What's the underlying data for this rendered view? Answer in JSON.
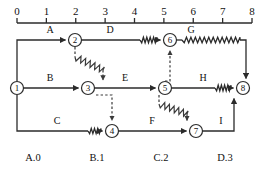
{
  "diagram": {
    "colors": {
      "line": "#2b2b2b",
      "dashed": "#3a3a3a",
      "text": "#111111",
      "background": "#ffffff"
    },
    "axis": {
      "name": "time-scale",
      "ticks": [
        "0",
        "1",
        "2",
        "3",
        "4",
        "5",
        "6",
        "7",
        "8"
      ],
      "min": 0,
      "max": 8
    },
    "nodes": [
      {
        "id": "1",
        "label": "1",
        "x": 17,
        "y": 88
      },
      {
        "id": "2",
        "label": "2",
        "x": 75,
        "y": 40
      },
      {
        "id": "3",
        "label": "3",
        "x": 88,
        "y": 88
      },
      {
        "id": "4",
        "label": "4",
        "x": 112,
        "y": 131
      },
      {
        "id": "5",
        "label": "5",
        "x": 165,
        "y": 88
      },
      {
        "id": "6",
        "label": "6",
        "x": 170,
        "y": 40
      },
      {
        "id": "7",
        "label": "7",
        "x": 196,
        "y": 131
      },
      {
        "id": "8",
        "label": "8",
        "x": 243,
        "y": 88
      }
    ],
    "edges": [
      {
        "id": "A",
        "label": "A",
        "from": "1",
        "to": "2",
        "style": "solid",
        "label_x": 50,
        "label_y": 33
      },
      {
        "id": "B",
        "label": "B",
        "from": "1",
        "to": "3",
        "style": "solid",
        "label_x": 50,
        "label_y": 81
      },
      {
        "id": "C",
        "label": "C",
        "from": "1",
        "to": "4",
        "style": "spring",
        "label_x": 57,
        "label_y": 124
      },
      {
        "id": "D",
        "label": "D",
        "from": "2",
        "to": "6",
        "style": "spring",
        "label_x": 110,
        "label_y": 33
      },
      {
        "id": "E",
        "label": "E",
        "from": "3",
        "to": "5",
        "style": "solid",
        "label_x": 125,
        "label_y": 81
      },
      {
        "id": "F",
        "label": "F",
        "from": "4",
        "to": "7",
        "style": "solid",
        "label_x": 152,
        "label_y": 124
      },
      {
        "id": "G",
        "label": "G",
        "from": "6",
        "to": "8",
        "style": "spring",
        "label_x": 191,
        "label_y": 33
      },
      {
        "id": "H",
        "label": "H",
        "from": "5",
        "to": "8",
        "style": "spring",
        "label_x": 203,
        "label_y": 81
      },
      {
        "id": "I",
        "label": "I",
        "from": "7",
        "to": "8",
        "style": "solid",
        "label_x": 221,
        "label_y": 124
      }
    ],
    "dependencies": [
      {
        "id": "dep-2-3",
        "from": "2",
        "to": "3",
        "style": "dashed-spring",
        "direction": "down"
      },
      {
        "id": "dep-3-4",
        "from": "3",
        "to": "4",
        "style": "dashed",
        "direction": "down"
      },
      {
        "id": "dep-5-6",
        "from": "5",
        "to": "6",
        "style": "dashed",
        "direction": "up"
      },
      {
        "id": "dep-5-7",
        "from": "5",
        "to": "7",
        "style": "dashed-spring",
        "direction": "down"
      }
    ],
    "bottom_labels": [
      {
        "id": "lbl-a0",
        "text": "A.0",
        "x": 33
      },
      {
        "id": "lbl-b1",
        "text": "B.1",
        "x": 97
      },
      {
        "id": "lbl-c2",
        "text": "C.2",
        "x": 161
      },
      {
        "id": "lbl-d3",
        "text": "D.3",
        "x": 225
      }
    ]
  }
}
